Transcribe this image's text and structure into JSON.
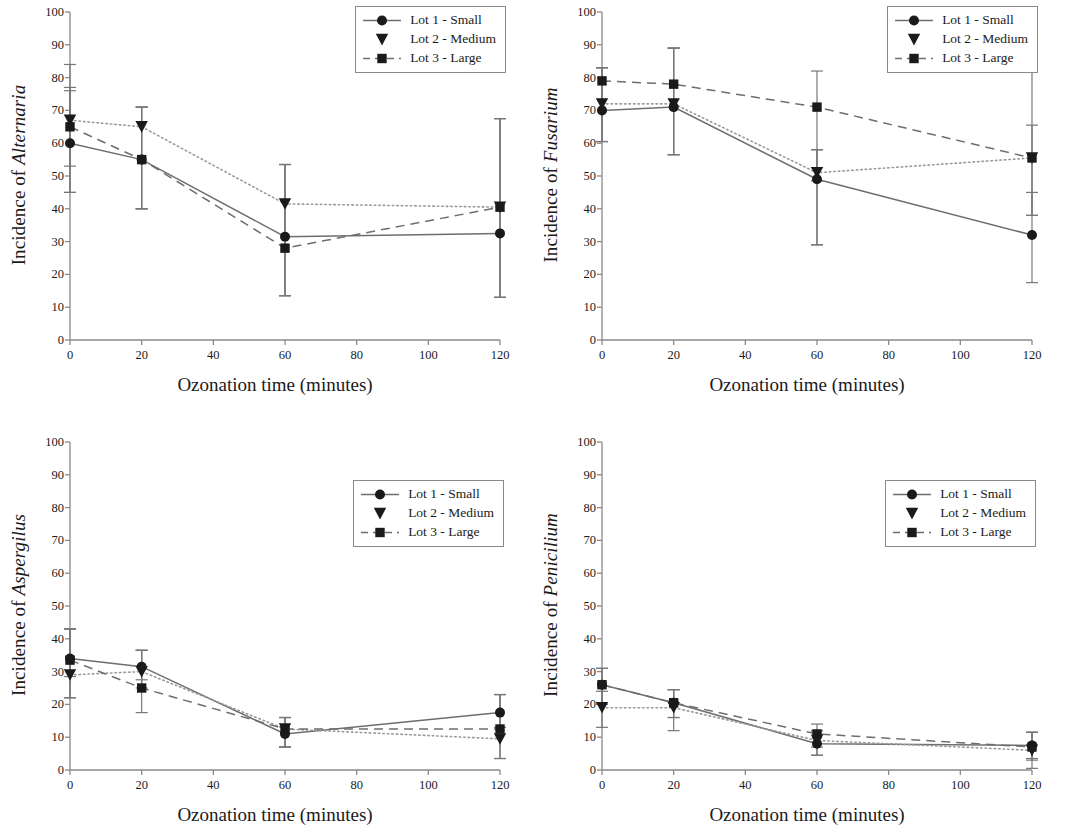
{
  "figure": {
    "xlabel": "Ozonation time (minutes)",
    "series_names": [
      "Lot 1 - Small",
      "Lot 2 - Medium",
      "Lot 3 - Large"
    ],
    "x_ticks": [
      0,
      20,
      40,
      60,
      80,
      100,
      120
    ],
    "y_ticks": [
      0,
      10,
      20,
      30,
      40,
      50,
      60,
      70,
      80,
      90,
      100
    ],
    "colors": {
      "ink": "#1a1a1a",
      "axis": "#8a8a8a",
      "error_bar": "#777777"
    }
  },
  "chart_data": [
    {
      "type": "line",
      "panel": "top-left",
      "title": "",
      "ylabel_prefix": "Incidence of ",
      "ylabel_genus": "Alternaria",
      "xlabel": "Ozonation time (minutes)",
      "x": [
        0,
        20,
        60,
        120
      ],
      "xlim": [
        0,
        120
      ],
      "ylim": [
        0,
        100
      ],
      "grid": false,
      "legend_position": "top-right",
      "series": [
        {
          "name": "Lot 1 - Small",
          "marker": "circle",
          "line": "solid",
          "values": [
            60,
            55,
            31.5,
            32.5
          ],
          "err_low": [
            15,
            15,
            18,
            19.5
          ],
          "err_high": [
            16,
            16,
            22,
            35
          ]
        },
        {
          "name": "Lot 2 - Medium",
          "marker": "triangle",
          "line": "dotted",
          "values": [
            67,
            65,
            41.5,
            40.5
          ],
          "err_low": [
            14,
            25,
            28,
            27.5
          ],
          "err_high": [
            10,
            6,
            12,
            27
          ]
        },
        {
          "name": "Lot 3 - Large",
          "marker": "square",
          "line": "dashed",
          "values": [
            65,
            55,
            28,
            40.5
          ],
          "err_low": [
            20,
            15,
            14.5,
            27.5
          ],
          "err_high": [
            19,
            16,
            25.5,
            27
          ]
        }
      ]
    },
    {
      "type": "line",
      "panel": "top-right",
      "title": "",
      "ylabel_prefix": "Incidence of ",
      "ylabel_genus": "Fusarium",
      "xlabel": "Ozonation time (minutes)",
      "x": [
        0,
        20,
        60,
        120
      ],
      "xlim": [
        0,
        120
      ],
      "ylim": [
        0,
        100
      ],
      "grid": false,
      "legend_position": "top-right",
      "series": [
        {
          "name": "Lot 1 - Small",
          "marker": "circle",
          "line": "solid",
          "values": [
            70,
            71,
            49,
            32
          ],
          "err_low": [
            9.5,
            14.5,
            20,
            14.5
          ],
          "err_high": [
            13,
            18,
            9,
            13
          ]
        },
        {
          "name": "Lot 2 - Medium",
          "marker": "triangle",
          "line": "dotted",
          "values": [
            72,
            72,
            51,
            55.5
          ],
          "err_low": [
            11.5,
            15.5,
            22,
            17.5
          ],
          "err_high": [
            11,
            17,
            7,
            10
          ]
        },
        {
          "name": "Lot 3 - Large",
          "marker": "square",
          "line": "dashed",
          "values": [
            79,
            78,
            71,
            55.5
          ],
          "err_low": [
            18.5,
            21.5,
            22.5,
            17.5
          ],
          "err_high": [
            4,
            11,
            11,
            29.5
          ]
        }
      ]
    },
    {
      "type": "line",
      "panel": "bottom-left",
      "title": "",
      "ylabel_prefix": "Incidence of ",
      "ylabel_genus": "Aspergilus",
      "xlabel": "Ozonation time (minutes)",
      "x": [
        0,
        20,
        60,
        120
      ],
      "xlim": [
        0,
        120
      ],
      "ylim": [
        0,
        100
      ],
      "grid": false,
      "legend_position": "top-right",
      "series": [
        {
          "name": "Lot 1 - Small",
          "marker": "circle",
          "line": "solid",
          "values": [
            34,
            31.5,
            11,
            17.5
          ],
          "err_low": [
            5.5,
            4,
            4,
            4.5
          ],
          "err_high": [
            9,
            5,
            5,
            5.5
          ]
        },
        {
          "name": "Lot 2 - Medium",
          "marker": "triangle",
          "line": "dotted",
          "values": [
            29,
            30,
            12.5,
            9.5
          ],
          "err_low": [
            7,
            5,
            5.5,
            6
          ],
          "err_high": [
            14,
            6.5,
            3.5,
            13.5
          ]
        },
        {
          "name": "Lot 3 - Large",
          "marker": "square",
          "line": "dashed",
          "values": [
            33.5,
            25,
            12.5,
            12.5
          ],
          "err_low": [
            11.5,
            7.5,
            5.5,
            9
          ],
          "err_high": [
            9.5,
            11.5,
            3.5,
            10.5
          ]
        }
      ]
    },
    {
      "type": "line",
      "panel": "bottom-right",
      "title": "",
      "ylabel_prefix": "Incidence of ",
      "ylabel_genus": "Penicilium",
      "xlabel": "Ozonation time (minutes)",
      "x": [
        0,
        20,
        60,
        120
      ],
      "xlim": [
        0,
        120
      ],
      "ylim": [
        0,
        100
      ],
      "grid": false,
      "legend_position": "top-right",
      "series": [
        {
          "name": "Lot 1 - Small",
          "marker": "circle",
          "line": "solid",
          "values": [
            26,
            20.5,
            8,
            7.5
          ],
          "err_low": [
            6,
            4.5,
            3.5,
            4
          ],
          "err_high": [
            5,
            4,
            4,
            4
          ]
        },
        {
          "name": "Lot 2 - Medium",
          "marker": "triangle",
          "line": "dotted",
          "values": [
            19,
            19,
            9,
            6
          ],
          "err_low": [
            6,
            7,
            4.5,
            5.5
          ],
          "err_high": [
            5,
            5.5,
            3,
            5.5
          ]
        },
        {
          "name": "Lot 3 - Large",
          "marker": "square",
          "line": "dashed",
          "values": [
            26,
            20.5,
            11,
            7
          ],
          "err_low": [
            6,
            4.5,
            4,
            4
          ],
          "err_high": [
            5,
            4,
            3,
            4.5
          ]
        }
      ]
    }
  ]
}
